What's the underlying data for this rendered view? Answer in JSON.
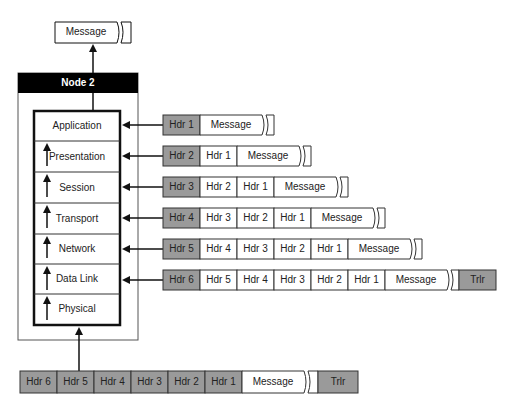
{
  "diagram": {
    "top_message": "Message",
    "node": {
      "title": "Node 2"
    },
    "layers": [
      {
        "name": "Application"
      },
      {
        "name": "Presentation"
      },
      {
        "name": "Session"
      },
      {
        "name": "Transport"
      },
      {
        "name": "Network"
      },
      {
        "name": "Data Link"
      },
      {
        "name": "Physical"
      }
    ],
    "packets": [
      {
        "layer": "Application",
        "cells": [
          "Hdr 1",
          "Message"
        ],
        "trailer": null
      },
      {
        "layer": "Presentation",
        "cells": [
          "Hdr 2",
          "Hdr 1",
          "Message"
        ],
        "trailer": null
      },
      {
        "layer": "Session",
        "cells": [
          "Hdr 3",
          "Hdr 2",
          "Hdr 1",
          "Message"
        ],
        "trailer": null
      },
      {
        "layer": "Transport",
        "cells": [
          "Hdr 4",
          "Hdr 3",
          "Hdr 2",
          "Hdr 1",
          "Message"
        ],
        "trailer": null
      },
      {
        "layer": "Network",
        "cells": [
          "Hdr 5",
          "Hdr 4",
          "Hdr 3",
          "Hdr 2",
          "Hdr 1",
          "Message"
        ],
        "trailer": null
      },
      {
        "layer": "Data Link",
        "cells": [
          "Hdr 6",
          "Hdr 5",
          "Hdr 4",
          "Hdr 3",
          "Hdr 2",
          "Hdr 1",
          "Message"
        ],
        "trailer": "Trlr"
      }
    ],
    "bottom_frame": {
      "cells": [
        "Hdr 6",
        "Hdr 5",
        "Hdr 4",
        "Hdr 3",
        "Hdr 2",
        "Hdr 1",
        "Message"
      ],
      "trailer": "Trlr"
    },
    "colors": {
      "header_fill": "#9a9a9a",
      "node_title_bg": "#000000",
      "line": "#111111"
    }
  }
}
